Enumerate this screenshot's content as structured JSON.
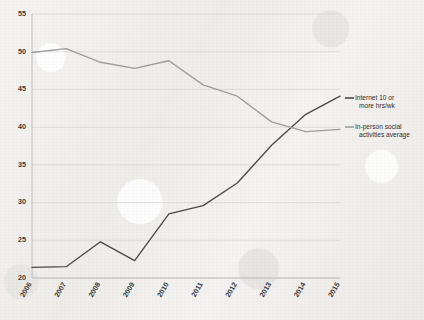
{
  "chart_data": {
    "type": "line",
    "title": "",
    "subtitle": "",
    "xlabel": "",
    "ylabel": "",
    "x": [
      2006,
      2007,
      2008,
      2009,
      2010,
      2011,
      2012,
      2013,
      2014,
      2015
    ],
    "categories": [
      "2006",
      "2007",
      "2008",
      "2009",
      "2010",
      "2011",
      "2012",
      "2013",
      "2014",
      "2015"
    ],
    "xlim": [
      2006,
      2015
    ],
    "ylim": [
      20,
      55
    ],
    "yticks": [
      20,
      25,
      30,
      35,
      40,
      45,
      50,
      55
    ],
    "ytick_labels": [
      "20",
      "25",
      "30",
      "35",
      "40",
      "45",
      "50",
      "55"
    ],
    "grid": "horizontal",
    "legend_position": "right",
    "series": [
      {
        "name": "Internet 10 or more hrs/wk",
        "color": "#4a4a4a",
        "values": [
          21.4,
          21.5,
          24.8,
          22.3,
          28.5,
          29.6,
          32.6,
          37.6,
          41.7,
          44.1
        ]
      },
      {
        "name": "In-person social activities average",
        "color": "#9d9d9d",
        "values": [
          49.9,
          50.4,
          48.6,
          47.8,
          48.8,
          45.6,
          44.1,
          40.7,
          39.4,
          39.7
        ]
      }
    ]
  },
  "legend": {
    "entries": [
      {
        "label_line1": "Internet 10 or",
        "label_line2": "more hrs/wk",
        "color": "#4a4a4a"
      },
      {
        "label_line1": "In-person social",
        "label_line2": "activities average",
        "color": "#9d9d9d"
      }
    ]
  },
  "axes": {
    "y_axis_color": "#b9b9b9",
    "x_axis_color": "#b9b9b9",
    "gridline_color": "#d2d2d2"
  },
  "canvas": {
    "background_color": "#f2f1ef"
  }
}
